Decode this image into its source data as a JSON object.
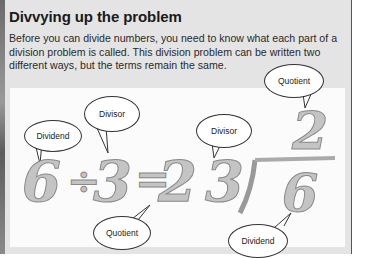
{
  "title": "Divvying up the problem",
  "paragraph": "Before you can divide numbers, you need to know what each part of a division problem is called. This division problem can be written two different ways, but the terms remain the same.",
  "figure": {
    "horizontal": {
      "dividend_digit": "6",
      "op_symbol": "÷",
      "divisor_digit": "3",
      "equals": "=",
      "quotient_digit": "2",
      "labels": {
        "dividend": "Dividend",
        "divisor": "Divisor",
        "quotient": "Quotient"
      }
    },
    "long_division": {
      "divisor_digit": "3",
      "dividend_digit": "6",
      "quotient_digit": "2",
      "labels": {
        "divisor": "Divisor",
        "quotient": "Quotient",
        "dividend": "Dividend"
      }
    }
  }
}
